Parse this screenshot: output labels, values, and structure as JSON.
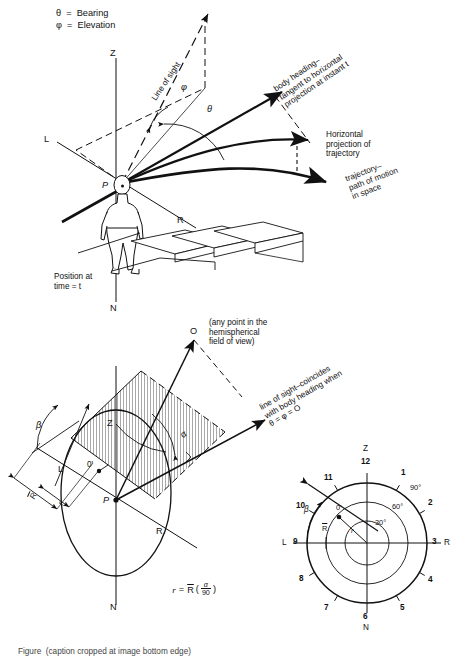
{
  "figure": {
    "domain": "technical-diagram",
    "caption": "Figure  (caption cropped at image bottom edge)"
  },
  "legend": {
    "theta_line": "θ  =  Bearing",
    "phi_line": "φ  =  Elevation"
  },
  "panel_top": {
    "axis_z": "Z",
    "axis_n": "N",
    "axis_l": "L",
    "axis_r": "R",
    "origin": "P",
    "line_of_sight": "Line of sight",
    "angle_phi": "φ",
    "angle_theta": "θ",
    "body_heading": "body heading–\ntangent to horizontal\nprojection at instant t",
    "horizontal_projection": "Horizontal\nprojection of\ntrajectory",
    "trajectory": "trajectory–\npath of motion\nin space",
    "position_note": "Position at\ntime = t"
  },
  "panel_mid": {
    "point_o": "O",
    "hemisphere_note": "(any point in the\nhemispherical\nfield of view)",
    "axis_z": "Z",
    "axis_n": "N",
    "axis_l": "L",
    "axis_r": "R",
    "origin": "P",
    "point_o_prime": "0'",
    "angle_beta": "β",
    "angle_alpha": "α",
    "radius_big": "R",
    "radius_small": "r",
    "sight_note": "line of sight–coincides\nwith body heading when\nθ = φ = O",
    "formula": {
      "lhs": "r",
      "eq": "=",
      "rbar": "R",
      "open": "(",
      "numerator": "α",
      "denominator": "90",
      "close": ")"
    }
  },
  "panel_clock": {
    "axis_z": "Z",
    "axis_n": "N",
    "axis_l": "L",
    "axis_r": "R",
    "angle_beta": "β",
    "radius_big": "R",
    "radius_small": "r",
    "point_o_prime": "0'",
    "hours": [
      "12",
      "1",
      "2",
      "3",
      "4",
      "5",
      "6",
      "7",
      "8",
      "9",
      "10",
      "11"
    ],
    "rings": [
      "30°",
      "60°",
      "90°"
    ]
  },
  "colors": {
    "ink": "#111111",
    "paper": "#ffffff",
    "hatch": "#333333"
  }
}
